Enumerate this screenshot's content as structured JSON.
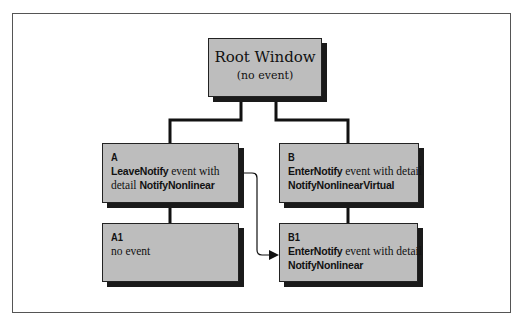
{
  "diagram": {
    "root": {
      "title": "Root Window",
      "subtitle": "(no event)"
    },
    "nodes": {
      "A": {
        "label": "A",
        "line1_bold": "LeaveNotify",
        "line1_rest": " event with",
        "line2_prefix": "detail ",
        "line2_bold": "NotifyNonlinear"
      },
      "B": {
        "label": "B",
        "line1_bold": "EnterNotify",
        "line1_rest": " event with detail",
        "line2_bold": "NotifyNonlinearVirtual"
      },
      "A1": {
        "label": "A1",
        "line1": "no event"
      },
      "B1": {
        "label": "B1",
        "line1_bold": "EnterNotify",
        "line1_rest": " event with detail",
        "line2_bold": "NotifyNonlinear"
      }
    },
    "edges": [
      {
        "from": "Root",
        "to": "A",
        "type": "tree"
      },
      {
        "from": "Root",
        "to": "B",
        "type": "tree"
      },
      {
        "from": "A",
        "to": "A1",
        "type": "tree"
      },
      {
        "from": "B",
        "to": "B1",
        "type": "tree"
      },
      {
        "from": "A",
        "to": "B1",
        "type": "arrow",
        "meaning": "pointer moves from A to B1"
      }
    ],
    "colors": {
      "box_fill": "#bdbdbd",
      "box_border": "#222222",
      "shadow": "#1a1a1a",
      "line": "#111111"
    }
  }
}
